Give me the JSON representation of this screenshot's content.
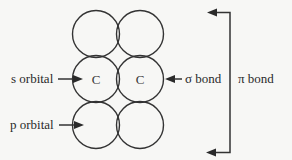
{
  "diagram": {
    "title": "",
    "orbitals": [
      {
        "row": 0,
        "col": 0,
        "cx": 96,
        "cy": 34,
        "r": 23.5
      },
      {
        "row": 0,
        "col": 1,
        "cx": 140,
        "cy": 34,
        "r": 23.5
      },
      {
        "row": 1,
        "col": 0,
        "cx": 96,
        "cy": 79,
        "r": 23.5
      },
      {
        "row": 1,
        "col": 1,
        "cx": 140,
        "cy": 79,
        "r": 23.5
      },
      {
        "row": 2,
        "col": 0,
        "cx": 96,
        "cy": 125,
        "r": 23.5
      },
      {
        "row": 2,
        "col": 1,
        "cx": 140,
        "cy": 125,
        "r": 23.5
      }
    ],
    "atoms": [
      {
        "label": "C",
        "x": 96,
        "y": 79
      },
      {
        "label": "C",
        "x": 140,
        "y": 79
      }
    ],
    "labels": {
      "s_orbital": "s orbital",
      "p_orbital": "p orbital",
      "sigma_bond": "σ bond",
      "pi_bond": "π bond"
    },
    "colors": {
      "line": "#333333",
      "text": "#2a2a2a",
      "background": "#f7f7f5"
    }
  }
}
